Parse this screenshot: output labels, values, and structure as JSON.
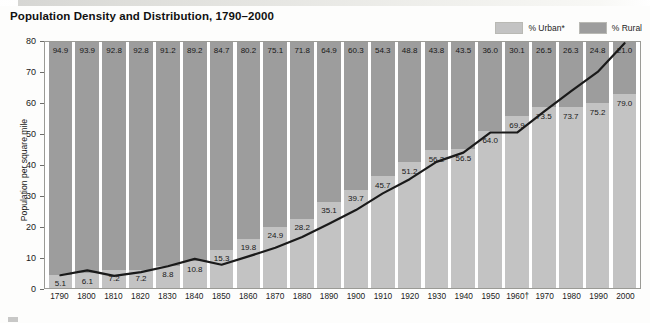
{
  "title": "Population Density and Distribution, 1790–2000",
  "legend": {
    "items": [
      {
        "label": "% Urban*",
        "color": "#c3c3c3",
        "key": "urban"
      },
      {
        "label": "% Rural",
        "color": "#9d9d9d",
        "key": "rural"
      }
    ]
  },
  "footnote": {
    "text": ""
  },
  "chart_data": {
    "type": "bar",
    "title": "Population Density and Distribution, 1790–2000",
    "subtype": "100% stacked bar with overlaid line",
    "categories": [
      "1790",
      "1800",
      "1810",
      "1820",
      "1830",
      "1840",
      "1850",
      "1860",
      "1870",
      "1880",
      "1890",
      "1900",
      "1910",
      "1920",
      "1930",
      "1940",
      "1950",
      "1960†",
      "1970",
      "1980",
      "1990",
      "2000"
    ],
    "xlabel": "",
    "ylabel": "Population per square mile",
    "ylim": [
      0,
      80
    ],
    "yticks": [
      0,
      10,
      20,
      30,
      40,
      50,
      60,
      70,
      80
    ],
    "grid": false,
    "legend_position": "top-right",
    "series": [
      {
        "name": "% Rural",
        "type": "bar-segment",
        "color": "#9d9d9d",
        "values": [
          94.9,
          93.9,
          92.8,
          92.8,
          91.2,
          89.2,
          84.7,
          80.2,
          75.1,
          71.8,
          64.9,
          60.3,
          54.3,
          48.8,
          43.8,
          43.5,
          36.0,
          30.1,
          26.5,
          26.3,
          24.8,
          21.0
        ]
      },
      {
        "name": "% Urban*",
        "type": "bar-segment",
        "color": "#c3c3c3",
        "values": [
          5.1,
          6.1,
          7.2,
          7.2,
          8.8,
          10.8,
          15.3,
          19.8,
          24.9,
          28.2,
          35.1,
          39.7,
          45.7,
          51.2,
          56.2,
          56.5,
          64.0,
          69.9,
          73.5,
          73.7,
          75.2,
          79.0
        ]
      },
      {
        "name": "Population per square mile",
        "type": "line",
        "color": "#1a1a1a",
        "values": [
          4.5,
          6.1,
          4.3,
          5.5,
          7.4,
          9.8,
          7.9,
          10.6,
          13.4,
          16.9,
          21.2,
          25.6,
          31.0,
          35.6,
          41.2,
          44.2,
          50.7,
          50.7,
          57.5,
          64.0,
          70.3,
          79.6
        ]
      }
    ]
  }
}
